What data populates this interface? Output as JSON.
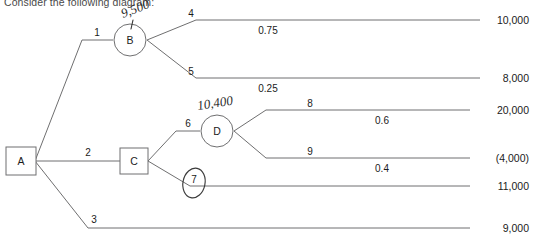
{
  "heading": "Consider the following diagram:",
  "nodes": [
    {
      "id": "A",
      "label": "A",
      "shape": "square"
    },
    {
      "id": "B",
      "label": "B",
      "shape": "circle"
    },
    {
      "id": "C",
      "label": "C",
      "shape": "square"
    },
    {
      "id": "D",
      "label": "D",
      "shape": "circle"
    }
  ],
  "branches": [
    {
      "num": "1",
      "from": "A",
      "to": "B"
    },
    {
      "num": "2",
      "from": "A",
      "to": "C"
    },
    {
      "num": "3",
      "from": "A",
      "to": "payoff-9000"
    },
    {
      "num": "4",
      "from": "B",
      "to": "payoff-10000"
    },
    {
      "num": "5",
      "from": "B",
      "to": "payoff-8000"
    },
    {
      "num": "6",
      "from": "C",
      "to": "D"
    },
    {
      "num": "7",
      "from": "C",
      "to": "payoff-11000"
    },
    {
      "num": "8",
      "from": "D",
      "to": "payoff-20000"
    },
    {
      "num": "9",
      "from": "D",
      "to": "payoff-4000"
    }
  ],
  "probabilities": [
    {
      "branch": "4",
      "value": "0.75"
    },
    {
      "branch": "5",
      "value": "0.25"
    },
    {
      "branch": "8",
      "value": "0.6"
    },
    {
      "branch": "9",
      "value": "0.4"
    }
  ],
  "payoffs": [
    {
      "branch": "4",
      "value": "10,000"
    },
    {
      "branch": "5",
      "value": "8,000"
    },
    {
      "branch": "8",
      "value": "20,000"
    },
    {
      "branch": "9",
      "value": "(4,000)"
    },
    {
      "branch": "7",
      "value": "11,000"
    },
    {
      "branch": "3",
      "value": "9,000"
    }
  ],
  "annotations": [
    {
      "id": "ev-b",
      "text": "9,500",
      "near": "B"
    },
    {
      "id": "ev-d",
      "text": "10,400",
      "near": "D"
    },
    {
      "id": "circle-7",
      "text": "",
      "near": "branch-7"
    }
  ],
  "colors": {
    "line": "#6f6f70",
    "text": "#1b1b1b",
    "ink": "#2b2b2b",
    "background": "#ffffff"
  }
}
